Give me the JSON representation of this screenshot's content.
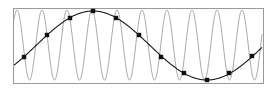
{
  "diagram": {
    "title": "",
    "frame": {
      "x": 13,
      "y": 8,
      "width": 250,
      "height": 75,
      "stroke": "#9a9a9a"
    },
    "high_freq_wave": {
      "color": "#a8a8a8",
      "center_y": 45,
      "amplitude": 35,
      "period_px": 25,
      "first_peak_x": 17,
      "x_start": 14,
      "x_end": 262
    },
    "alias_wave": {
      "color": "#1a1a1a",
      "center_y": 45.5,
      "amplitude": 34.5,
      "period_px": 228,
      "peak_x": 93,
      "x_start": 14,
      "x_end": 262
    },
    "samples": {
      "color": "#111111",
      "radius": 2.2,
      "points": [
        [
          24,
          57
        ],
        [
          47,
          35
        ],
        [
          70,
          18
        ],
        [
          93,
          11
        ],
        [
          116,
          18
        ],
        [
          139,
          35
        ],
        [
          161,
          57
        ],
        [
          184,
          73
        ],
        [
          207,
          80
        ],
        [
          229,
          73
        ],
        [
          252,
          56
        ]
      ]
    }
  }
}
